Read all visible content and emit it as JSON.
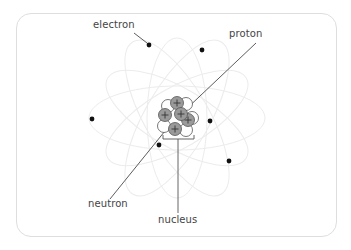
{
  "diagram": {
    "labels": {
      "electron": "electron",
      "proton": "proton",
      "neutron": "neutron",
      "nucleus": "nucleus"
    },
    "colors": {
      "frame": "#dedede",
      "orbit": "#ececec",
      "electron": "#111111",
      "proton_fill": "#9a9a9a",
      "neutron_fill": "#ffffff",
      "line": "#333333"
    },
    "nucleus_center": [
      177,
      118
    ],
    "electrons": [
      {
        "x": 149,
        "y": 45
      },
      {
        "x": 202,
        "y": 50
      },
      {
        "x": 92,
        "y": 119
      },
      {
        "x": 210,
        "y": 121
      },
      {
        "x": 159,
        "y": 145
      },
      {
        "x": 229,
        "y": 161
      }
    ],
    "particles": [
      {
        "type": "neutron",
        "x": 168,
        "y": 106
      },
      {
        "type": "neutron",
        "x": 186,
        "y": 104
      },
      {
        "type": "neutron",
        "x": 192,
        "y": 118
      },
      {
        "type": "neutron",
        "x": 164,
        "y": 126
      },
      {
        "type": "neutron",
        "x": 186,
        "y": 130
      },
      {
        "type": "proton",
        "x": 177,
        "y": 103
      },
      {
        "type": "proton",
        "x": 165,
        "y": 115
      },
      {
        "type": "proton",
        "x": 188,
        "y": 120
      },
      {
        "type": "proton",
        "x": 181,
        "y": 114
      },
      {
        "type": "proton",
        "x": 175,
        "y": 129
      }
    ]
  }
}
